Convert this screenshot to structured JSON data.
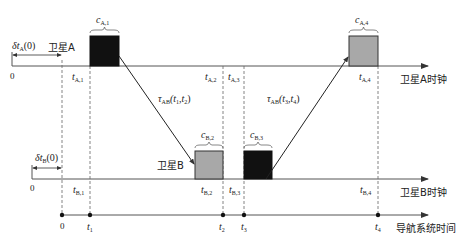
{
  "diagram": {
    "axes": {
      "satA_clock": "卫星A时钟",
      "satB_clock": "卫星B时钟",
      "system_time": "导航系统时间"
    },
    "satellites": {
      "A": "卫星A",
      "B": "卫星B"
    },
    "offsets": {
      "deltaA": "δt",
      "deltaA_sub": "A",
      "deltaA_arg": "(0)",
      "deltaB": "δt",
      "deltaB_sub": "B",
      "deltaB_arg": "(0)"
    },
    "origin_labels": {
      "satA_zero": "0",
      "satB_zero": "0",
      "system_zero": "0"
    },
    "satA_ticks": [
      {
        "main": "t",
        "sub": "A,1"
      },
      {
        "main": "t",
        "sub": "A,2"
      },
      {
        "main": "t",
        "sub": "A,3"
      },
      {
        "main": "t",
        "sub": "A,4"
      }
    ],
    "satB_ticks": [
      {
        "main": "t",
        "sub": "B,1"
      },
      {
        "main": "t",
        "sub": "B,2"
      },
      {
        "main": "t",
        "sub": "B,3"
      },
      {
        "main": "t",
        "sub": "B,4"
      }
    ],
    "system_ticks": [
      {
        "main": "t",
        "sub": "1"
      },
      {
        "main": "t",
        "sub": "2"
      },
      {
        "main": "t",
        "sub": "3"
      },
      {
        "main": "t",
        "sub": "4"
      }
    ],
    "blocks": [
      {
        "main": "c",
        "sub": "A,1",
        "fill": "#111111"
      },
      {
        "main": "c",
        "sub": "B,2",
        "fill": "#a8a8a8"
      },
      {
        "main": "c",
        "sub": "B,3",
        "fill": "#111111"
      },
      {
        "main": "c",
        "sub": "A,4",
        "fill": "#a8a8a8"
      }
    ],
    "links": [
      {
        "main": "τ",
        "sub": "AB",
        "args": "(t",
        "a1": "1",
        "sep": ",t",
        "a2": "2",
        "close": ")"
      },
      {
        "main": "τ",
        "sub": "AB",
        "args": "(t",
        "a1": "3",
        "sep": ",t",
        "a2": "4",
        "close": ")"
      }
    ]
  }
}
